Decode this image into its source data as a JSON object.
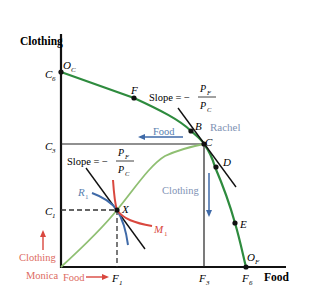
{
  "axes": {
    "y_label": "Clothing",
    "x_label": "Food"
  },
  "ticks": {
    "y": [
      {
        "main": "C",
        "sub": "6"
      },
      {
        "main": "C",
        "sub": "3"
      },
      {
        "main": "C",
        "sub": "1"
      }
    ],
    "x": [
      {
        "main": "F",
        "sub": "1"
      },
      {
        "main": "F",
        "sub": "3"
      },
      {
        "main": "F",
        "sub": "6"
      }
    ]
  },
  "origins": {
    "clothing": {
      "main": "O",
      "sub": "C"
    },
    "food": {
      "main": "O",
      "sub": "F"
    }
  },
  "points": {
    "F": "F",
    "B": "B",
    "C": "C",
    "D": "D",
    "E": "E",
    "X": "X"
  },
  "slope_labels": {
    "prefix": "Slope = −",
    "numerator": {
      "main": "P",
      "sub": "F"
    },
    "denominator": {
      "main": "P",
      "sub": "C"
    }
  },
  "curves": {
    "R1": {
      "main": "R",
      "sub": "1"
    },
    "M1": {
      "main": "M",
      "sub": "1"
    }
  },
  "annotations": {
    "rachel": "Rachel",
    "rachel_food": "Food",
    "rachel_clothing": "Clothing",
    "monica": "Monica",
    "monica_food": "Food",
    "monica_clothing": "Clothing"
  },
  "colors": {
    "ppf_green": "#2e8b3e",
    "contract_curve_green": "#8fbf72",
    "rachel_blue": "#5a7fb0",
    "rachel_label": "#7f93b5",
    "monica_red": "#d9473e",
    "monica_label": "#dd6b62",
    "axis": "#111111"
  }
}
